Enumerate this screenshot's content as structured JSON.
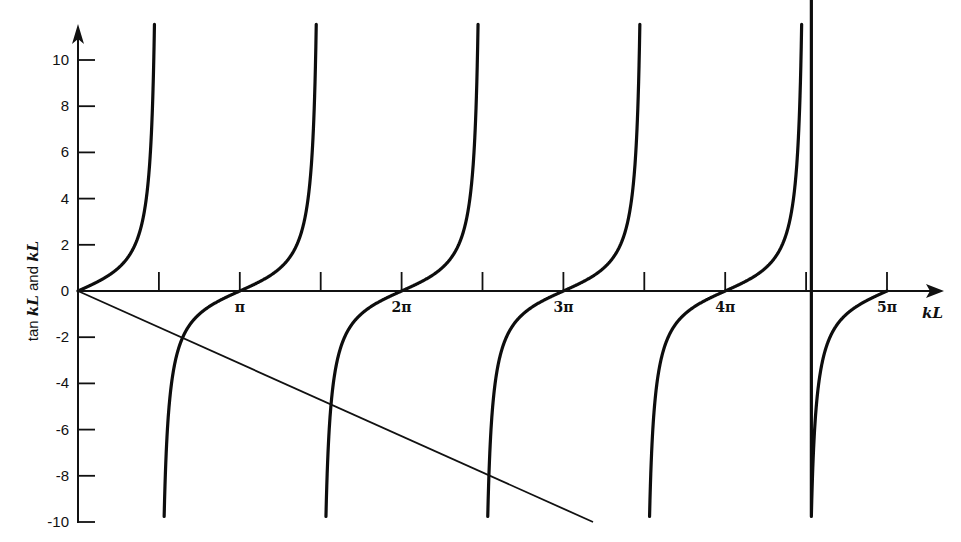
{
  "chart_data": {
    "type": "line",
    "title": "",
    "xlabel": "kL",
    "ylabel": "tan kL and kL",
    "ylabel_parts": [
      "tan ",
      "kL",
      " and ",
      "kL"
    ],
    "xlim": [
      0,
      15.708
    ],
    "ylim": [
      -10,
      10
    ],
    "y_ticks": [
      10,
      8,
      6,
      4,
      2,
      0,
      -2,
      -4,
      -6,
      -8,
      -10
    ],
    "y_tick_labels": [
      "10",
      "8",
      "6",
      "4",
      "2",
      "0",
      "-2",
      "-4",
      "-6",
      "-8",
      "-10"
    ],
    "x_ticks_halfpi": [
      1,
      2,
      3,
      4,
      5,
      6,
      7,
      8,
      9,
      10
    ],
    "x_tick_labels": {
      "2": "π",
      "4": "2π",
      "6": "3π",
      "8": "4π",
      "10": "5π"
    },
    "grid": false,
    "legend": null,
    "series": [
      {
        "name": "tan kL",
        "kind": "tan",
        "style": "thick",
        "branches": [
          {
            "from_halfpi": 0,
            "to_halfpi": 1,
            "y_top": 11.6
          },
          {
            "from_halfpi": 1,
            "to_halfpi": 3,
            "y_top": 11.6,
            "y_bottom": -10
          },
          {
            "from_halfpi": 3,
            "to_halfpi": 5,
            "y_top": 11.6,
            "y_bottom": -10
          },
          {
            "from_halfpi": 5,
            "to_halfpi": 7,
            "y_top": 11.6,
            "y_bottom": -10
          },
          {
            "from_halfpi": 7,
            "to_halfpi": 9,
            "y_top": 11.6,
            "y_bottom": -10
          },
          {
            "from_halfpi": 9,
            "to_halfpi": 10,
            "y_bottom": -10
          }
        ]
      },
      {
        "name": "-kL",
        "kind": "linear",
        "style": "thin",
        "slope": -1,
        "x": [
          0,
          10.0
        ],
        "y": [
          0,
          -10.0
        ]
      }
    ],
    "intersections_approx": [
      {
        "x": 2.03,
        "y": -2.03
      },
      {
        "x": 4.91,
        "y": -4.91
      },
      {
        "x": 7.98,
        "y": -7.98
      }
    ]
  }
}
